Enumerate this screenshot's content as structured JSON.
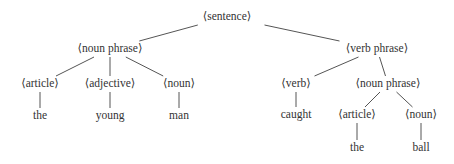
{
  "diagram": {
    "type": "parse-tree",
    "nodes": {
      "sentence": {
        "label": "⟨sentence⟩",
        "x": 227,
        "y": 17
      },
      "np1": {
        "label": "⟨noun phrase⟩",
        "x": 110,
        "y": 49
      },
      "vp": {
        "label": "⟨verb phrase⟩",
        "x": 377,
        "y": 49
      },
      "article1": {
        "label": "⟨article⟩",
        "x": 40,
        "y": 84
      },
      "adjective": {
        "label": "⟨adjective⟩",
        "x": 110,
        "y": 84
      },
      "noun1": {
        "label": "⟨noun⟩",
        "x": 179,
        "y": 84
      },
      "w_the1": {
        "label": "the",
        "x": 40,
        "y": 116
      },
      "w_young": {
        "label": "young",
        "x": 110,
        "y": 116
      },
      "w_man": {
        "label": "man",
        "x": 179,
        "y": 116
      },
      "verb": {
        "label": "⟨verb⟩",
        "x": 296,
        "y": 84
      },
      "np2": {
        "label": "⟨noun phrase⟩",
        "x": 388,
        "y": 84
      },
      "w_caught": {
        "label": "caught",
        "x": 296,
        "y": 115
      },
      "article2": {
        "label": "⟨article⟩",
        "x": 357,
        "y": 115
      },
      "noun2": {
        "label": "⟨noun⟩",
        "x": 421,
        "y": 115
      },
      "w_the2": {
        "label": "the",
        "x": 357,
        "y": 148
      },
      "w_ball": {
        "label": "ball",
        "x": 421,
        "y": 148
      }
    },
    "edges": [
      [
        "sentence",
        "np1"
      ],
      [
        "sentence",
        "vp"
      ],
      [
        "np1",
        "article1"
      ],
      [
        "np1",
        "adjective"
      ],
      [
        "np1",
        "noun1"
      ],
      [
        "article1",
        "w_the1"
      ],
      [
        "adjective",
        "w_young"
      ],
      [
        "noun1",
        "w_man"
      ],
      [
        "vp",
        "verb"
      ],
      [
        "vp",
        "np2"
      ],
      [
        "verb",
        "w_caught"
      ],
      [
        "np2",
        "article2"
      ],
      [
        "np2",
        "noun2"
      ],
      [
        "article2",
        "w_the2"
      ],
      [
        "noun2",
        "w_ball"
      ]
    ]
  }
}
